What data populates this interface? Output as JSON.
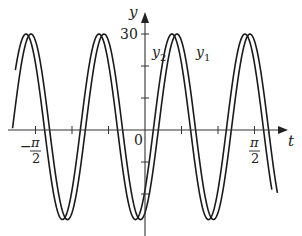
{
  "chart_data": {
    "type": "line",
    "title": "",
    "xlabel": "t",
    "ylabel": "y",
    "xlim": [
      -2.07,
      1.92
    ],
    "ylim": [
      -35,
      35
    ],
    "grid": false,
    "legend_position": "inline labels near curves",
    "x_ticks": [
      {
        "value": -1.5708,
        "label": "-π/2"
      },
      {
        "value": -1.0472,
        "label": ""
      },
      {
        "value": -0.5236,
        "label": ""
      },
      {
        "value": 0,
        "label": "0"
      },
      {
        "value": 0.5236,
        "label": ""
      },
      {
        "value": 1.0472,
        "label": ""
      },
      {
        "value": 1.5708,
        "label": "π/2"
      }
    ],
    "y_ticks": [
      {
        "value": 30,
        "label": "30"
      },
      {
        "value": 20,
        "label": ""
      },
      {
        "value": 10,
        "label": ""
      },
      {
        "value": 0,
        "label": ""
      },
      {
        "value": -10,
        "label": ""
      },
      {
        "value": -20,
        "label": ""
      }
    ],
    "series": [
      {
        "name": "y1",
        "label": "y",
        "sub": "1",
        "amplitude": 29,
        "offset": 1,
        "omega": 6,
        "peak_t": 1.506,
        "t_range": [
          -1.9,
          1.9
        ],
        "approx_peaks_t": [
          -1.63,
          -0.55,
          0.46,
          1.51
        ],
        "approx_troughs_t": [
          -1.08,
          -0.03,
          1.0
        ]
      },
      {
        "name": "y2",
        "label": "y",
        "sub": "2",
        "amplitude": 29,
        "offset": 1,
        "omega": 6,
        "peak_t": 1.434,
        "t_range": [
          -1.86,
          1.82
        ],
        "approx_peaks_t": [
          -1.7,
          -0.62,
          0.4,
          1.43
        ],
        "approx_troughs_t": [
          -1.13,
          -0.09,
          0.96
        ]
      }
    ],
    "annotations": {
      "y_axis_label": "y",
      "x_axis_label": "t",
      "origin_label": "0",
      "y30_label": "30",
      "neg_pi_half_num": "π",
      "neg_pi_half_den": "2",
      "neg_sign": "−",
      "pi_half_num": "π",
      "pi_half_den": "2",
      "y1_label": "y",
      "y1_sub": "1",
      "y2_label": "y",
      "y2_sub": "2"
    },
    "colors": {
      "curve": "#1a1a1a",
      "axis": "#333333",
      "background": "#ffffff"
    },
    "pixel_map": {
      "origin_x": 145,
      "origin_y": 130,
      "px_per_rad": 69.7,
      "px_per_unit_y": 3.2
    }
  }
}
